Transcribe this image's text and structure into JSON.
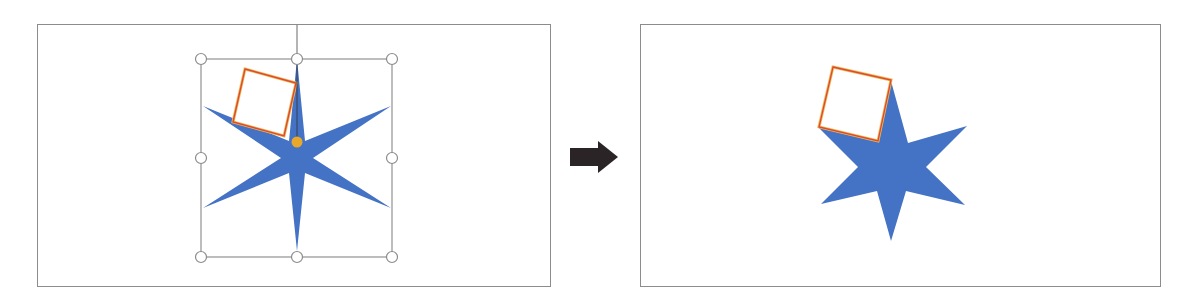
{
  "diagram": {
    "colors": {
      "star_fill": "#4472C4",
      "square_stroke_outer": "#E8A030",
      "square_stroke_inner": "#D94A3A",
      "square_fill": "#FFFFFF",
      "rotation_handle": "#E8A82A",
      "selection_frame": "#8C8C8C",
      "arrow_fill": "#2B2426",
      "panel_border": "#8C8C8C"
    },
    "panels": [
      {
        "id": "before",
        "label": "",
        "elements": [
          "six-point-star (selected)",
          "rotated-square",
          "selection-handles x8",
          "rotation-handle"
        ]
      },
      {
        "id": "after",
        "label": "",
        "elements": [
          "merged-shape: star + square"
        ]
      }
    ],
    "arrow": {
      "direction": "right",
      "icon": "arrow-right-icon"
    }
  }
}
